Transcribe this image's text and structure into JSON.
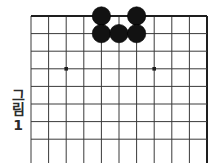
{
  "figure": {
    "label_chars": [
      "그",
      "림"
    ],
    "label_text": "그림",
    "number": "1",
    "full_caption": "그림1"
  },
  "board": {
    "kind": "go-board",
    "description": "Partial go (baduk) board, upper-right corner region, cropped at bottom",
    "columns": 11,
    "rows": 8,
    "cell_size": 17.6,
    "origin_x": 31,
    "origin_y": 16,
    "line_color": "#3a3a3a",
    "edge_color": "#1e1e1e",
    "background_color": "#ffffff",
    "line_width": 1.0,
    "edge_line_width": 2.0,
    "top_edge_visible": true,
    "right_edge_visible": true,
    "left_edge_visible": false,
    "bottom_edge_visible": false
  },
  "star_points": [
    {
      "name": "star-point-left",
      "col": 3,
      "row": 4
    },
    {
      "name": "star-point-right",
      "col": 8,
      "row": 4
    }
  ],
  "stones": [
    {
      "name": "black-stone-1",
      "color": "#121212",
      "col": 5,
      "row": 1
    },
    {
      "name": "black-stone-2",
      "color": "#121212",
      "col": 7,
      "row": 1
    },
    {
      "name": "black-stone-3",
      "color": "#121212",
      "col": 5,
      "row": 2
    },
    {
      "name": "black-stone-4",
      "color": "#121212",
      "col": 6,
      "row": 2
    },
    {
      "name": "black-stone-5",
      "color": "#121212",
      "col": 7,
      "row": 2
    }
  ],
  "stone_style": {
    "radius": 9.2,
    "fill": "#121212",
    "stroke": "#000000"
  }
}
